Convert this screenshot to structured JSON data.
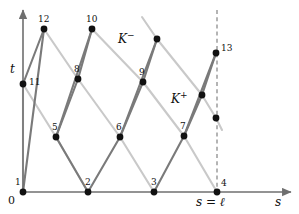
{
  "figure": {
    "type": "characteristics-diagram",
    "width": 299,
    "height": 214,
    "background": "#ffffff",
    "colors": {
      "axis": "#6f6f6f",
      "curve_dark": "#7a7a7a",
      "curve_light": "#c9c9c9",
      "point": "#111111",
      "dashed": "#777777",
      "text": "#111111"
    }
  },
  "axes": {
    "origin_label": "0",
    "x_axis_label": "s",
    "y_axis_label": "t",
    "x_axis": {
      "x_start": 23,
      "x_end": 291,
      "y": 192
    },
    "y_axis": {
      "x": 23,
      "y_start": 192,
      "y_end": 10
    },
    "boundary_label": "s = ℓ",
    "boundary_x": 217
  },
  "families": {
    "minus_label": "K−",
    "minus_label_display": "K",
    "minus_sup": "−",
    "plus_label": "K+",
    "plus_label_display": "K",
    "plus_sup": "+"
  },
  "annotations": [
    {
      "name": "k-minus-label",
      "text": "K",
      "sup": "−",
      "x": 118,
      "y": 31
    },
    {
      "name": "k-plus-label",
      "text": "K",
      "sup": "+",
      "x": 171,
      "y": 91
    }
  ],
  "points": [
    {
      "id": "1",
      "label": "1",
      "x": 23,
      "y": 192,
      "label_x": 15,
      "label_y": 178,
      "labeled": true
    },
    {
      "id": "2",
      "label": "2",
      "x": 88,
      "y": 192,
      "label_x": 85,
      "label_y": 178,
      "labeled": true
    },
    {
      "id": "3",
      "label": "3",
      "x": 154,
      "y": 192,
      "label_x": 151,
      "label_y": 178,
      "labeled": true
    },
    {
      "id": "4",
      "label": "4",
      "x": 217,
      "y": 192,
      "label_x": 221,
      "label_y": 179,
      "labeled": true
    },
    {
      "id": "5",
      "label": "5",
      "x": 56,
      "y": 137,
      "label_x": 52,
      "label_y": 123,
      "labeled": true
    },
    {
      "id": "6",
      "label": "6",
      "x": 120,
      "y": 137,
      "label_x": 116,
      "label_y": 123,
      "labeled": true
    },
    {
      "id": "7",
      "label": "7",
      "x": 184,
      "y": 136,
      "label_x": 180,
      "label_y": 122,
      "labeled": true
    },
    {
      "id": "8",
      "label": "8",
      "x": 78,
      "y": 79,
      "label_x": 74,
      "label_y": 65,
      "labeled": true
    },
    {
      "id": "9",
      "label": "9",
      "x": 143,
      "y": 82,
      "label_x": 139,
      "label_y": 68,
      "labeled": true
    },
    {
      "id": "10",
      "label": "10",
      "x": 92,
      "y": 29,
      "label_x": 86,
      "label_y": 15,
      "labeled": true
    },
    {
      "id": "11",
      "label": "11",
      "x": 23,
      "y": 84,
      "label_x": 29,
      "label_y": 78,
      "labeled": true
    },
    {
      "id": "12",
      "label": "12",
      "x": 44,
      "y": 29,
      "label_x": 38,
      "label_y": 15,
      "labeled": true
    },
    {
      "id": "13",
      "label": "13",
      "x": 216,
      "y": 53,
      "label_x": 221,
      "label_y": 44,
      "labeled": true
    },
    {
      "id": "u1",
      "label": "",
      "x": 157,
      "y": 39,
      "labeled": false
    },
    {
      "id": "u2",
      "label": "",
      "x": 202,
      "y": 95,
      "labeled": false
    },
    {
      "id": "u3",
      "label": "",
      "x": 216,
      "y": 118,
      "labeled": false
    }
  ],
  "dark_segments": [
    {
      "from": [
        23,
        192
      ],
      "to": [
        44,
        29
      ]
    },
    {
      "from": [
        88,
        192
      ],
      "to": [
        56,
        137
      ]
    },
    {
      "from": [
        56,
        137
      ],
      "to": [
        92,
        29
      ]
    },
    {
      "from": [
        88,
        192
      ],
      "to": [
        120,
        137
      ]
    },
    {
      "from": [
        120,
        137
      ],
      "to": [
        157,
        39
      ]
    },
    {
      "from": [
        154,
        192
      ],
      "to": [
        184,
        136
      ]
    },
    {
      "from": [
        184,
        136
      ],
      "to": [
        216,
        53
      ]
    },
    {
      "from": [
        23,
        84
      ],
      "to": [
        44,
        29
      ]
    },
    {
      "from": [
        56,
        137
      ],
      "to": [
        78,
        79
      ]
    },
    {
      "from": [
        78,
        79
      ],
      "to": [
        92,
        29
      ]
    },
    {
      "from": [
        120,
        137
      ],
      "to": [
        143,
        82
      ]
    },
    {
      "from": [
        143,
        82
      ],
      "to": [
        157,
        39
      ]
    },
    {
      "from": [
        184,
        136
      ],
      "to": [
        202,
        95
      ]
    },
    {
      "from": [
        202,
        95
      ],
      "to": [
        216,
        53
      ]
    }
  ],
  "light_segments": [
    {
      "from": [
        23,
        192
      ],
      "to": [
        23,
        84
      ]
    },
    {
      "from": [
        23,
        84
      ],
      "to": [
        56,
        137
      ]
    },
    {
      "from": [
        56,
        137
      ],
      "to": [
        88,
        192
      ]
    },
    {
      "from": [
        44,
        29
      ],
      "to": [
        78,
        79
      ]
    },
    {
      "from": [
        78,
        79
      ],
      "to": [
        120,
        137
      ]
    },
    {
      "from": [
        120,
        137
      ],
      "to": [
        154,
        192
      ]
    },
    {
      "from": [
        92,
        29
      ],
      "to": [
        143,
        82
      ]
    },
    {
      "from": [
        143,
        82
      ],
      "to": [
        184,
        136
      ]
    },
    {
      "from": [
        184,
        136
      ],
      "to": [
        217,
        192
      ]
    },
    {
      "from": [
        142,
        17
      ],
      "to": [
        157,
        39
      ]
    },
    {
      "from": [
        157,
        39
      ],
      "to": [
        202,
        95
      ]
    },
    {
      "from": [
        202,
        95
      ],
      "to": [
        216,
        118
      ]
    },
    {
      "from": [
        216,
        118
      ],
      "to": [
        222,
        130
      ]
    }
  ],
  "dashed_line": {
    "x": 217,
    "y_top": 10,
    "y_bottom": 192
  }
}
